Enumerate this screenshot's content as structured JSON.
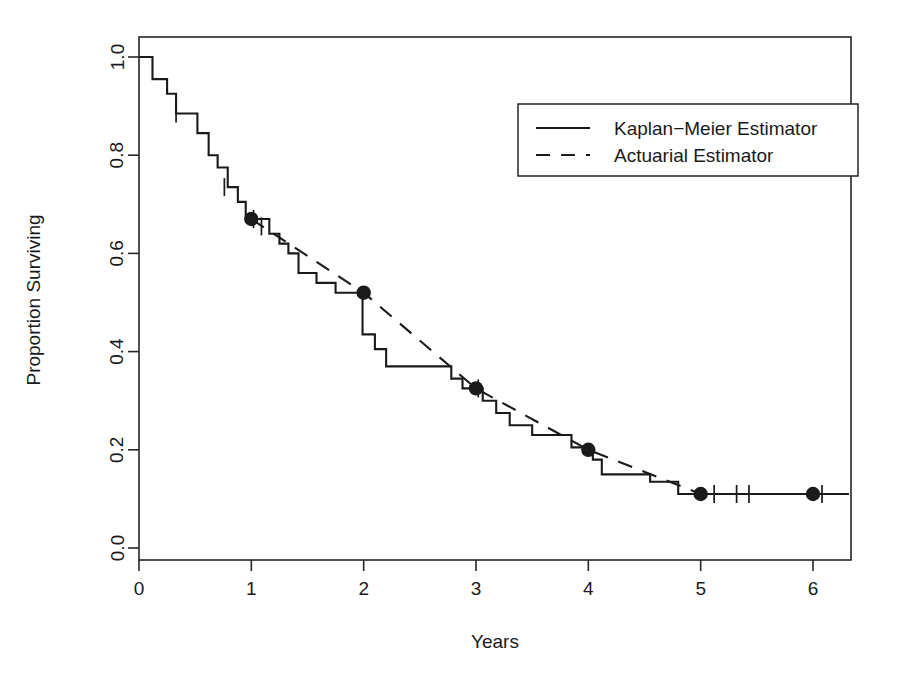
{
  "chart_data": {
    "type": "line",
    "title": "",
    "xlabel": "Years",
    "ylabel": "Proportion Surviving",
    "xlim": [
      0,
      6.35
    ],
    "ylim": [
      0,
      1.045
    ],
    "xticks": [
      0,
      1,
      2,
      3,
      4,
      5,
      6
    ],
    "xticklabels": [
      "0",
      "1",
      "2",
      "3",
      "4",
      "5",
      "6"
    ],
    "yticks": [
      0.0,
      0.2,
      0.4,
      0.6,
      0.8,
      1.0
    ],
    "yticklabels": [
      "0.0",
      "0.2",
      "0.4",
      "0.6",
      "0.8",
      "1.0"
    ],
    "grid": false,
    "frame": "box",
    "legend": {
      "position": "top-right",
      "entries": [
        {
          "label": "Kaplan−Meier Estimator",
          "style": "solid",
          "color": "#1a1a1a"
        },
        {
          "label": "Actuarial Estimator",
          "style": "dashed",
          "color": "#1a1a1a"
        }
      ]
    },
    "series": [
      {
        "name": "Kaplan−Meier Estimator",
        "type": "step",
        "style": "solid",
        "color": "#1a1a1a",
        "points": [
          [
            0.0,
            1.0
          ],
          [
            0.12,
            1.0
          ],
          [
            0.12,
            0.955
          ],
          [
            0.25,
            0.955
          ],
          [
            0.25,
            0.925
          ],
          [
            0.33,
            0.925
          ],
          [
            0.33,
            0.885
          ],
          [
            0.52,
            0.885
          ],
          [
            0.52,
            0.845
          ],
          [
            0.62,
            0.845
          ],
          [
            0.62,
            0.8
          ],
          [
            0.7,
            0.8
          ],
          [
            0.7,
            0.775
          ],
          [
            0.79,
            0.775
          ],
          [
            0.79,
            0.735
          ],
          [
            0.88,
            0.735
          ],
          [
            0.88,
            0.705
          ],
          [
            0.95,
            0.705
          ],
          [
            0.95,
            0.67
          ],
          [
            1.16,
            0.67
          ],
          [
            1.16,
            0.64
          ],
          [
            1.25,
            0.64
          ],
          [
            1.25,
            0.62
          ],
          [
            1.33,
            0.62
          ],
          [
            1.33,
            0.6
          ],
          [
            1.42,
            0.6
          ],
          [
            1.42,
            0.56
          ],
          [
            1.58,
            0.56
          ],
          [
            1.58,
            0.54
          ],
          [
            1.75,
            0.54
          ],
          [
            1.75,
            0.52
          ],
          [
            1.99,
            0.52
          ],
          [
            1.99,
            0.435
          ],
          [
            2.1,
            0.435
          ],
          [
            2.1,
            0.405
          ],
          [
            2.2,
            0.405
          ],
          [
            2.2,
            0.37
          ],
          [
            2.78,
            0.37
          ],
          [
            2.78,
            0.345
          ],
          [
            2.88,
            0.345
          ],
          [
            2.88,
            0.325
          ],
          [
            3.06,
            0.325
          ],
          [
            3.06,
            0.3
          ],
          [
            3.18,
            0.3
          ],
          [
            3.18,
            0.275
          ],
          [
            3.3,
            0.275
          ],
          [
            3.3,
            0.25
          ],
          [
            3.5,
            0.25
          ],
          [
            3.5,
            0.23
          ],
          [
            3.85,
            0.23
          ],
          [
            3.85,
            0.205
          ],
          [
            4.04,
            0.205
          ],
          [
            4.04,
            0.18
          ],
          [
            4.12,
            0.18
          ],
          [
            4.12,
            0.15
          ],
          [
            4.55,
            0.15
          ],
          [
            4.55,
            0.135
          ],
          [
            4.8,
            0.135
          ],
          [
            4.8,
            0.11
          ],
          [
            6.32,
            0.11
          ]
        ],
        "censor_marks": [
          [
            0.33,
            0.885
          ],
          [
            0.76,
            0.735
          ],
          [
            1.02,
            0.67
          ],
          [
            1.09,
            0.655
          ],
          [
            3.02,
            0.325
          ],
          [
            5.12,
            0.11
          ],
          [
            5.32,
            0.11
          ],
          [
            5.43,
            0.11
          ],
          [
            6.08,
            0.11
          ]
        ]
      },
      {
        "name": "Actuarial Estimator",
        "type": "line",
        "style": "dashed",
        "color": "#1a1a1a",
        "points": [
          [
            1.0,
            0.67
          ],
          [
            2.0,
            0.52
          ],
          [
            3.0,
            0.325
          ],
          [
            4.0,
            0.2
          ],
          [
            5.0,
            0.11
          ],
          [
            6.0,
            0.11
          ]
        ],
        "markers": [
          [
            1.0,
            0.67
          ],
          [
            2.0,
            0.52
          ],
          [
            3.0,
            0.325
          ],
          [
            4.0,
            0.2
          ],
          [
            5.0,
            0.11
          ],
          [
            6.0,
            0.11
          ]
        ]
      }
    ]
  }
}
